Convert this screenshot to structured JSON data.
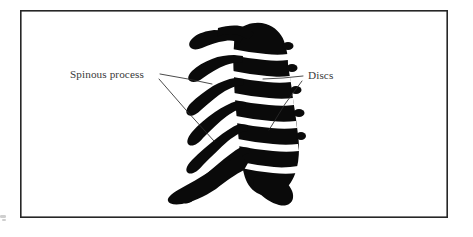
{
  "figure": {
    "kind": "anatomical-line-illustration",
    "background_color": "#ffffff",
    "ink_color": "#0a0a0a",
    "border_color": "#262626",
    "text_color": "#3a3a3a",
    "canvas": {
      "width": 473,
      "height": 237
    }
  },
  "frame": {
    "name": "figure-border",
    "x": 20,
    "y": 10,
    "width": 428,
    "height": 208
  },
  "labels": [
    {
      "id": "spinous-process",
      "text": "Spinous process",
      "x": 70,
      "y": 78,
      "anchor": "start",
      "leaders": [
        {
          "id": "spinous-leader-upper",
          "points": "160,74 188,79 211,84"
        },
        {
          "id": "spinous-leader-lower",
          "points": "159,79 186,110 213,141"
        }
      ]
    },
    {
      "id": "discs",
      "text": "Discs",
      "x": 308,
      "y": 79,
      "anchor": "start",
      "leaders": [
        {
          "id": "discs-leader-upper",
          "points": "303,76 281,78 263,79"
        },
        {
          "id": "discs-leader-lower",
          "points": "302,81 284,105 268,131"
        }
      ]
    }
  ],
  "vertebrae": [
    {
      "index": 1,
      "name": "C2-axis",
      "body_cx": 253,
      "body_cy": 40,
      "process_tip_x": 196,
      "process_tip_y": 48
    },
    {
      "index": 2,
      "name": "C3",
      "body_cx": 256,
      "body_cy": 63,
      "process_tip_x": 191,
      "process_tip_y": 74
    },
    {
      "index": 3,
      "name": "C4",
      "body_cx": 259,
      "body_cy": 85,
      "process_tip_x": 186,
      "process_tip_y": 99
    },
    {
      "index": 4,
      "name": "C5",
      "body_cx": 262,
      "body_cy": 107,
      "process_tip_x": 184,
      "process_tip_y": 123
    },
    {
      "index": 5,
      "name": "C6",
      "body_cx": 265,
      "body_cy": 130,
      "process_tip_x": 181,
      "process_tip_y": 147
    },
    {
      "index": 6,
      "name": "C7",
      "body_cx": 264,
      "body_cy": 153,
      "process_tip_x": 178,
      "process_tip_y": 172
    },
    {
      "index": 7,
      "name": "T1",
      "body_cx": 260,
      "body_cy": 176,
      "process_tip_x": 170,
      "process_tip_y": 196
    }
  ],
  "discs_gaps": [
    {
      "index": 1,
      "between": "C2-C3",
      "y": 52
    },
    {
      "index": 2,
      "between": "C3-C4",
      "y": 74
    },
    {
      "index": 3,
      "between": "C4-C5",
      "y": 96
    },
    {
      "index": 4,
      "between": "C5-C6",
      "y": 119
    },
    {
      "index": 5,
      "between": "C6-C7",
      "y": 142
    },
    {
      "index": 6,
      "between": "C7-T1",
      "y": 165
    }
  ],
  "shapes": {
    "spine_silhouette": "M247,22 C254,20 264,21 271,25 C278,29 282,35 284,41 L286,48 C288,52 288,55 285,57 L272,56 C266,55 261,54 256,52 L243,50 C236,49 230,48 224,47 L210,47 C204,48 200,49 197,51 C194,53 191,53 189,51 C187,49 188,46 191,44 L204,38 C211,34 218,31 226,28 C233,25 240,23 247,22 Z",
    "process_stub": "M190,46 C196,44 203,43 210,43"
  }
}
